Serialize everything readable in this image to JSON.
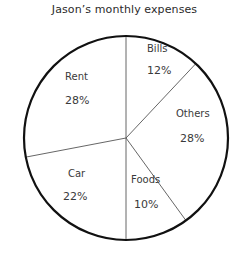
{
  "chart_data": {
    "type": "pie",
    "title": "Jason’s monthly expenses",
    "xlabel": "",
    "ylabel": "",
    "legend": "none",
    "grid": false,
    "units": "percent",
    "start_angle_deg": 0,
    "direction": "clockwise",
    "total": 100,
    "categories": [
      "Bills",
      "Others",
      "Foods",
      "Car",
      "Rent"
    ],
    "values": [
      12,
      28,
      10,
      22,
      28
    ],
    "value_labels": [
      "12%",
      "28%",
      "10%",
      "22%",
      "28%"
    ],
    "slices": [
      {
        "name": "Bills",
        "value": 12,
        "value_label": "12%",
        "start_deg": 0,
        "end_deg": 43.2,
        "fill": "#ffffff",
        "label_x": 147,
        "label_y": 43,
        "value_x": 147,
        "value_y": 65
      },
      {
        "name": "Others",
        "value": 28,
        "value_label": "28%",
        "start_deg": 43.2,
        "end_deg": 144,
        "fill": "#ffffff",
        "label_x": 176,
        "label_y": 108,
        "value_x": 180,
        "value_y": 133
      },
      {
        "name": "Foods",
        "value": 10,
        "value_label": "10%",
        "start_deg": 144,
        "end_deg": 180,
        "fill": "#ffffff",
        "label_x": 131,
        "label_y": 174,
        "value_x": 134,
        "value_y": 199
      },
      {
        "name": "Car",
        "value": 22,
        "value_label": "22%",
        "start_deg": 180,
        "end_deg": 259.2,
        "fill": "#ffffff",
        "label_x": 68,
        "label_y": 168,
        "value_x": 63,
        "value_y": 191
      },
      {
        "name": "Rent",
        "value": 28,
        "value_label": "28%",
        "start_deg": 259.2,
        "end_deg": 360,
        "fill": "#ffffff",
        "label_x": 65,
        "label_y": 71,
        "value_x": 65,
        "value_y": 95
      }
    ],
    "geometry": {
      "center_x": 126,
      "center_y": 138,
      "radius": 102,
      "outline_color": "#111111",
      "outline_width": 2.2,
      "divider_color": "#555555",
      "divider_width": 0.9
    }
  }
}
